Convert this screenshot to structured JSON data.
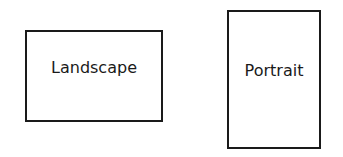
{
  "diagram": {
    "shapes": [
      {
        "id": "landscape",
        "label": "Landscape",
        "orientation": "horizontal rectangle"
      },
      {
        "id": "portrait",
        "label": "Portrait",
        "orientation": "vertical rectangle"
      }
    ],
    "colors": {
      "stroke": "#1a1a1a",
      "fill": "#ffffff",
      "background": "#ffffff"
    }
  }
}
